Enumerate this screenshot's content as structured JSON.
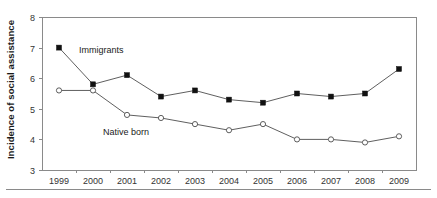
{
  "chart_data": {
    "type": "line",
    "title": "",
    "xlabel": "",
    "ylabel": "Incidence of social assistance",
    "x": [
      1999,
      2000,
      2001,
      2002,
      2003,
      2004,
      2005,
      2006,
      2007,
      2008,
      2009
    ],
    "categories": [
      "1999",
      "2000",
      "2001",
      "2002",
      "2003",
      "2004",
      "2005",
      "2006",
      "2007",
      "2008",
      "2009"
    ],
    "ylim": [
      3,
      8
    ],
    "yticks": [
      3,
      4,
      5,
      6,
      7,
      8
    ],
    "ytick_labels": [
      "3",
      "4",
      "5",
      "6",
      "7",
      "8"
    ],
    "grid": false,
    "legend_position": "inline-annotation",
    "series": [
      {
        "name": "Immigrants",
        "marker": "filled-square",
        "color": "#111111",
        "values": [
          7.0,
          5.8,
          6.1,
          5.4,
          5.6,
          5.3,
          5.2,
          5.5,
          5.4,
          5.5,
          6.3
        ]
      },
      {
        "name": "Native born",
        "marker": "open-circle",
        "color": "#4d4d4d",
        "values": [
          5.6,
          5.6,
          4.8,
          4.7,
          4.5,
          4.3,
          4.5,
          4.0,
          4.0,
          3.9,
          4.1
        ]
      }
    ],
    "annotations": [
      {
        "text": "Immigrants",
        "series": "Immigrants"
      },
      {
        "text": "Native born",
        "series": "Native born"
      }
    ]
  },
  "colors": {
    "axis": "#8a8a8a",
    "line": "#4d4d4d",
    "marker_filled": "#111111",
    "text": "#1a1a1a",
    "background": "#ffffff"
  }
}
